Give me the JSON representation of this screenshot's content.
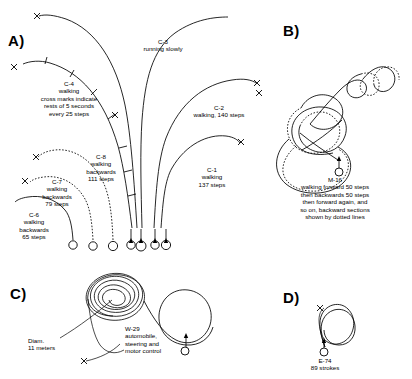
{
  "figure": {
    "panels": [
      {
        "id": "A",
        "label": "A)",
        "tracks": [
          {
            "code": "C-3",
            "caption": "C-3\nrunning slowly",
            "lines": [
              "C-3",
              "running slowly"
            ],
            "mode": "running",
            "direction": "forward",
            "style": "solid"
          },
          {
            "code": "C-4",
            "caption": "C-4\nwalking\ncross marks indicate\nrests of 5 seconds\nevery 25 steps",
            "lines": [
              "C-4",
              "walking",
              "cross marks indicate",
              "rests of 5 seconds",
              "every 25 steps"
            ],
            "mode": "walking",
            "direction": "forward",
            "style": "solid",
            "rest_seconds": 5,
            "rest_interval_steps": 25
          },
          {
            "code": "C-2",
            "caption": "C-2\nwalking, 140 steps",
            "lines": [
              "C-2",
              "walking, 140 steps"
            ],
            "mode": "walking",
            "direction": "forward",
            "steps": 140,
            "style": "solid"
          },
          {
            "code": "C-1",
            "caption": "C-1\nwalking\n137 steps",
            "lines": [
              "C-1",
              "walking",
              "137 steps"
            ],
            "mode": "walking",
            "direction": "forward",
            "steps": 137,
            "style": "solid"
          },
          {
            "code": "C-8",
            "caption": "C-8\nwalking\nbackwards\n111 steps",
            "lines": [
              "C-8",
              "walking",
              "backwards",
              "111 steps"
            ],
            "mode": "walking",
            "direction": "backwards",
            "steps": 111,
            "style": "dotted"
          },
          {
            "code": "C-7",
            "caption": "C-7\nwalking\nbackwards\n79 steps",
            "lines": [
              "C-7",
              "walking",
              "backwards",
              "79 steps"
            ],
            "mode": "walking",
            "direction": "backwards",
            "steps": 79,
            "style": "dotted"
          },
          {
            "code": "C-6",
            "caption": "C-6\nwalking\nbackwards\n65 steps",
            "lines": [
              "C-6",
              "walking",
              "backwards",
              "65 steps"
            ],
            "mode": "walking",
            "direction": "backwards",
            "steps": 65,
            "style": "dotted"
          }
        ]
      },
      {
        "id": "B",
        "label": "B)",
        "tracks": [
          {
            "code": "M-16",
            "caption": "M-16\nwalking forward 50 steps\nthen backwards 50 steps\nthen forward again, and\nso on, backward sections\nshown by dotted lines",
            "lines": [
              "M-16",
              "walking forward 50 steps",
              "then backwards 50 steps",
              "then forward again, and",
              "so on, backward sections",
              "shown by dotted lines"
            ],
            "forward_steps": 50,
            "backward_steps": 50,
            "style": "mixed"
          }
        ]
      },
      {
        "id": "C",
        "label": "C)",
        "tracks": [
          {
            "code": "W-29",
            "caption": "W-29\nautomobile,\nsteering and\nmotor control",
            "lines": [
              "W-29",
              "automobile,",
              "steering and",
              "motor control"
            ],
            "style": "solid"
          }
        ],
        "annotations": [
          {
            "name": "diameter-annotation",
            "caption": "Diam.\n11 meters",
            "lines": [
              "Diam.",
              "11 meters"
            ],
            "value": 11,
            "unit": "meters"
          }
        ]
      },
      {
        "id": "D",
        "label": "D)",
        "tracks": [
          {
            "code": "E-74",
            "caption": "E-74\n89 strokes",
            "lines": [
              "E-74",
              "89 strokes"
            ],
            "strokes": 89,
            "style": "solid"
          }
        ]
      }
    ],
    "markers": {
      "start_symbol": "circle",
      "end_symbol": "x",
      "rest_symbol": "cross-tick"
    },
    "colors": {
      "stroke": "#000000",
      "background": "#ffffff"
    }
  }
}
